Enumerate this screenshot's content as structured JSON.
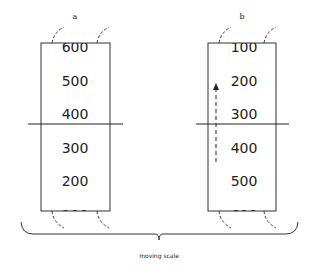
{
  "panel_a": {
    "label": "a",
    "scale_values": [
      "600",
      "500",
      "400",
      "300",
      "200",
      "100"
    ]
  },
  "panel_b": {
    "label": "b",
    "scale_values": [
      "100",
      "200",
      "300",
      "400",
      "500",
      "600"
    ],
    "arrow_direction": "up"
  },
  "caption": "moving scale"
}
